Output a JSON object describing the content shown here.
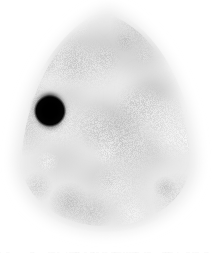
{
  "image": {
    "kind": "scintigraphy-slice",
    "modality_label": "Nuclear medicine tomographic slice",
    "width": 212,
    "height": 257,
    "background_color": "#ffffff",
    "colormap": "grayscale-inverted",
    "alt_text": "Grayscale pear-shaped body cross-section with mottled uptake and one intense focal black hotspot at left"
  },
  "body_outline": {
    "shape": "teardrop",
    "apex_x": 108,
    "apex_y": 8,
    "center_x": 106,
    "center_y": 140,
    "half_width": 90,
    "top_y": 8,
    "bottom_y": 232,
    "edge_blur_px": 13,
    "base_gray": "#e9e9e9",
    "rim_gray": "#f4f4f4"
  },
  "texture": {
    "description": "mottled low-contrast parenchymal uptake",
    "blob_count": 46,
    "min_gray": "#bdbdbd",
    "max_gray": "#f0f0f0",
    "noise_opacity": 0.16,
    "seed": 20250731
  },
  "hot_blobs": [
    {
      "name": "upper-mid-band",
      "x": 106,
      "y": 48,
      "rx": 40,
      "ry": 16,
      "gray": "#cfcfcf",
      "blur": 13
    },
    {
      "name": "upper-left-patch",
      "x": 74,
      "y": 62,
      "rx": 20,
      "ry": 14,
      "gray": "#d2d2d2",
      "blur": 12
    },
    {
      "name": "upper-right-patch",
      "x": 140,
      "y": 58,
      "rx": 22,
      "ry": 13,
      "gray": "#d4d4d4",
      "blur": 12
    },
    {
      "name": "right-mid-focus",
      "x": 152,
      "y": 93,
      "rx": 18,
      "ry": 16,
      "gray": "#c6c6c6",
      "blur": 11
    },
    {
      "name": "central-core",
      "x": 103,
      "y": 122,
      "rx": 26,
      "ry": 20,
      "gray": "#cacaca",
      "blur": 13
    },
    {
      "name": "left-mid-patch",
      "x": 66,
      "y": 100,
      "rx": 18,
      "ry": 15,
      "gray": "#d6d6d6",
      "blur": 12
    },
    {
      "name": "lower-left-patch",
      "x": 62,
      "y": 160,
      "rx": 22,
      "ry": 16,
      "gray": "#d8d8d8",
      "blur": 13
    },
    {
      "name": "lower-mid-band",
      "x": 112,
      "y": 176,
      "rx": 36,
      "ry": 15,
      "gray": "#d5d5d5",
      "blur": 14
    },
    {
      "name": "lower-right-patch",
      "x": 150,
      "y": 150,
      "rx": 20,
      "ry": 18,
      "gray": "#d3d3d3",
      "blur": 13
    },
    {
      "name": "inferior-rim",
      "x": 104,
      "y": 206,
      "rx": 44,
      "ry": 13,
      "gray": "#dedede",
      "blur": 14
    }
  ],
  "lesion": {
    "name": "focal-hotspot",
    "label": "Focal uptake",
    "center_x": 50,
    "center_y": 111,
    "radius_x": 12,
    "radius_y": 14,
    "core_color": "#000000",
    "halo_color": "#3a3a3a",
    "halo_blur_px": 4,
    "rotation_deg": -12
  },
  "artifacts": {
    "bottom_strip_y": 252,
    "bottom_strip_opacity": 0.07,
    "bottom_strip_color": "#b9b9b9"
  }
}
